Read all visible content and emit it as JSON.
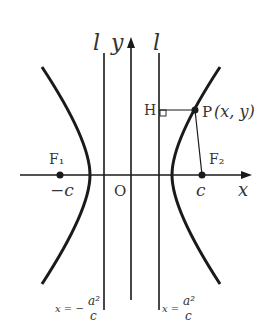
{
  "diagram": {
    "type": "hyperbola-directrix",
    "colors": {
      "stroke": "#1a1a1a",
      "text": "#333333",
      "background": "#ffffff"
    },
    "axes": {
      "x_label": "x",
      "y_label": "y",
      "origin_label": "O"
    },
    "directrices": {
      "left_top_label": "l",
      "right_top_label": "l",
      "left_equation": {
        "prefix": "x = −",
        "numerator": "a²",
        "denominator": "c"
      },
      "right_equation": {
        "prefix": "x = ",
        "numerator": "a²",
        "denominator": "c"
      }
    },
    "foci": {
      "left": {
        "name": "F₁",
        "coord": "−c"
      },
      "right": {
        "name": "F₂",
        "coord": "c"
      }
    },
    "point": {
      "name": "P",
      "coords": "(x, y)"
    },
    "foot": {
      "name": "H"
    }
  }
}
